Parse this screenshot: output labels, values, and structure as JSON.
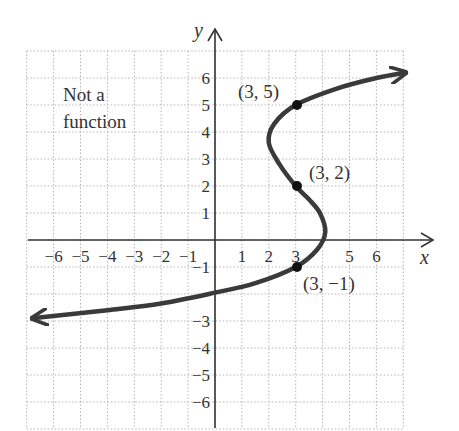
{
  "chart_data": {
    "type": "line",
    "title": "",
    "xlabel": "x",
    "ylabel": "y",
    "xlim": [
      -7,
      7
    ],
    "ylim": [
      -7,
      7
    ],
    "grid": true,
    "x_ticks": [
      "-6",
      "-5",
      "-4",
      "-3",
      "-2",
      "-1",
      "1",
      "2",
      "3",
      "5",
      "6"
    ],
    "y_ticks": [
      "6",
      "5",
      "4",
      "3",
      "2",
      "1",
      "-1",
      "-3",
      "-4",
      "-5",
      "-6"
    ],
    "annotation": "Not a\nfunction",
    "curve_color": "#3a3a3a",
    "series": [
      {
        "name": "relation",
        "points": [
          [
            -6.8,
            -2.9
          ],
          [
            -4,
            -2.6
          ],
          [
            -2,
            -2.35
          ],
          [
            0,
            -1.95
          ],
          [
            1.5,
            -1.6
          ],
          [
            3,
            -1
          ],
          [
            3.8,
            -0.35
          ],
          [
            4.1,
            0.3
          ],
          [
            3.9,
            1.0
          ],
          [
            3.5,
            1.5
          ],
          [
            3,
            2
          ],
          [
            2.4,
            2.8
          ],
          [
            2.0,
            3.6
          ],
          [
            2.2,
            4.3
          ],
          [
            3,
            5
          ],
          [
            4.5,
            5.6
          ],
          [
            6,
            6.0
          ],
          [
            7.1,
            6.2
          ]
        ],
        "arrows": "both"
      }
    ],
    "labeled_points": [
      {
        "label": "(3, 5)",
        "x": 3,
        "y": 5
      },
      {
        "label": "(3, 2)",
        "x": 3,
        "y": 2
      },
      {
        "label": "(3, −1)",
        "x": 3,
        "y": -1
      }
    ]
  },
  "labels": {
    "note_line1": "Not a",
    "note_line2": "function",
    "x_axis": "x",
    "y_axis": "y",
    "p1": "(3, 5)",
    "p2": "(3, 2)",
    "p3": "(3, −1)"
  },
  "ticks": {
    "x": [
      {
        "t": "−6",
        "v": -6
      },
      {
        "t": "−5",
        "v": -5
      },
      {
        "t": "−4",
        "v": -4
      },
      {
        "t": "−3",
        "v": -3
      },
      {
        "t": "−2",
        "v": -2
      },
      {
        "t": "−1",
        "v": -1
      },
      {
        "t": "1",
        "v": 1
      },
      {
        "t": "2",
        "v": 2
      },
      {
        "t": "3",
        "v": 3
      },
      {
        "t": "5",
        "v": 5
      },
      {
        "t": "6",
        "v": 6
      }
    ],
    "y": [
      {
        "t": "6",
        "v": 6
      },
      {
        "t": "5",
        "v": 5
      },
      {
        "t": "4",
        "v": 4
      },
      {
        "t": "3",
        "v": 3
      },
      {
        "t": "2",
        "v": 2
      },
      {
        "t": "1",
        "v": 1
      },
      {
        "t": "−1",
        "v": -1
      },
      {
        "t": "−3",
        "v": -3
      },
      {
        "t": "−4",
        "v": -4
      },
      {
        "t": "−5",
        "v": -5
      },
      {
        "t": "−6",
        "v": -6
      }
    ]
  }
}
